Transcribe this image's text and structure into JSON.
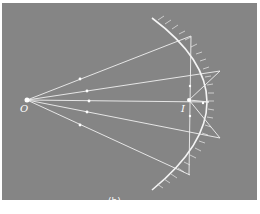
{
  "figure": {
    "caption": "(b)",
    "background_color": "#858585",
    "ray_color": "#f2f2f2"
  },
  "labels": {
    "object_point": "O",
    "image_point": "I"
  },
  "diagram": {
    "elements": [
      "point-source",
      "concave-mirror",
      "incident-rays",
      "reflected-rays",
      "image-point"
    ]
  }
}
